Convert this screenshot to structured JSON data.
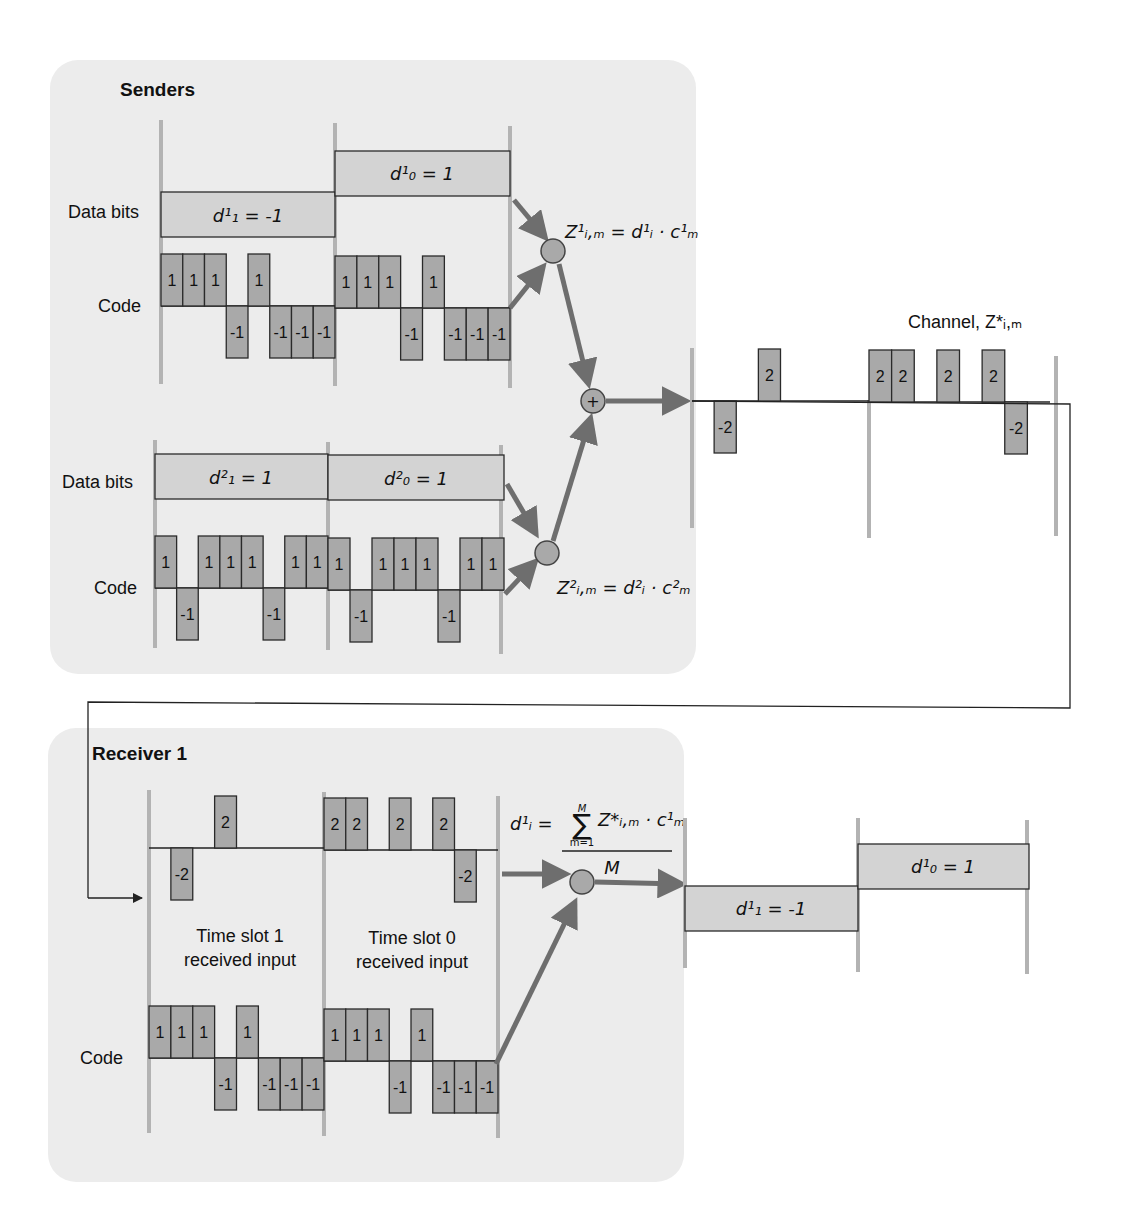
{
  "senders": {
    "title": "Senders",
    "sender1": {
      "data_label": "Data bits",
      "code_label": "Code",
      "bit1": "d¹₁ = -1",
      "bit0": "d¹₀ = 1",
      "bit1_value": -1,
      "bit0_value": 1,
      "code": [
        1,
        1,
        1,
        -1,
        1,
        -1,
        -1,
        -1
      ],
      "product_formula": "Z¹ᵢ,ₘ = d¹ᵢ · c¹ₘ"
    },
    "sender2": {
      "data_label": "Data bits",
      "code_label": "Code",
      "bit1": "d²₁ = 1",
      "bit0": "d²₀ = 1",
      "bit1_value": 1,
      "bit0_value": 1,
      "code": [
        1,
        -1,
        1,
        1,
        1,
        -1,
        1,
        1
      ],
      "product_formula": "Z²ᵢ,ₘ = d²ᵢ · c²ₘ"
    },
    "sum_symbol": "+"
  },
  "channel": {
    "label": "Channel, Z*ᵢ,ₘ",
    "slot1": [
      0,
      -2,
      0,
      2,
      0,
      0,
      0,
      0
    ],
    "slot0": [
      2,
      2,
      0,
      2,
      0,
      2,
      -2,
      0
    ]
  },
  "receiver": {
    "title": "Receiver 1",
    "slot1_caption_line1": "Time slot 1",
    "slot1_caption_line2": "received input",
    "slot0_caption_line1": "Time slot 0",
    "slot0_caption_line2": "received input",
    "code_label": "Code",
    "code": [
      1,
      1,
      1,
      -1,
      1,
      -1,
      -1,
      -1
    ],
    "formula_lhs": "d¹ᵢ =",
    "formula_sum": "∑",
    "formula_upper": "M",
    "formula_lower": "m=1",
    "formula_numerator": "Z*ᵢ,ₘ · c¹ₘ",
    "formula_denominator": "M",
    "output_bit1": "d¹₁ = -1",
    "output_bit0": "d¹₀ = 1"
  },
  "colors": {
    "panel": "#ececec",
    "chip": "#a9a9a9",
    "bitbox": "#d3d3d3",
    "arrow": "#6e6e6e",
    "grid": "#b3b3b3"
  }
}
